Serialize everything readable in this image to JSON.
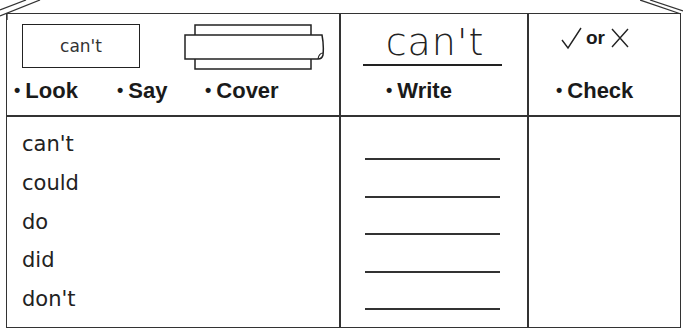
{
  "worksheet": {
    "header": {
      "look_box_word": "can't",
      "steps": [
        {
          "label": "Look",
          "bullet": "•"
        },
        {
          "label": "Say",
          "bullet": "•"
        },
        {
          "label": "Cover",
          "bullet": "•"
        }
      ],
      "model_word": "can't",
      "write_step": {
        "label": "Write",
        "bullet": "•"
      },
      "check_symbols": {
        "tick": "✓",
        "or": "or",
        "cross": "✕"
      },
      "check_step": {
        "label": "Check",
        "bullet": "•"
      }
    },
    "words": [
      "can't",
      "could",
      "do",
      "did",
      "don't"
    ],
    "write_lines_count": 5
  },
  "colors": {
    "line": "#333333",
    "text": "#1a1a1a",
    "background": "#ffffff"
  },
  "icons": {
    "cover_paper": "folded-paper-icon",
    "tick": "tick-icon",
    "cross": "cross-icon"
  }
}
